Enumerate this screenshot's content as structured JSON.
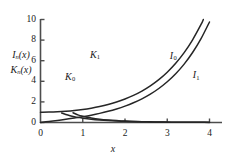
{
  "chart_data": {
    "type": "line",
    "title": "",
    "xlabel": "x",
    "ylabel_line1": "I",
    "ylabel_line1_sub": "n",
    "ylabel_line1_arg": "(x)",
    "ylabel_line2": "K",
    "ylabel_line2_sub": "n",
    "ylabel_line2_arg": "(x)",
    "xlim": [
      0,
      4
    ],
    "ylim": [
      0,
      10
    ],
    "xticks": [
      0,
      1,
      2,
      3,
      4
    ],
    "xtick_labels": [
      "0",
      "1",
      "2",
      "3",
      "4"
    ],
    "yticks": [
      0,
      2,
      4,
      6,
      8,
      10
    ],
    "ytick_labels": [
      "0",
      "2",
      "4",
      "6",
      "8",
      "10"
    ],
    "grid": false,
    "legend": "inline-curve-labels",
    "line_color": "#262626",
    "axis_color": "#4d4d4d",
    "background": "#ffffff",
    "series": [
      {
        "name": "I0",
        "label": "I",
        "label_sub": "0",
        "label_x": 3.18,
        "label_y": 6.45,
        "x": [
          0,
          0.2,
          0.4,
          0.6,
          0.8,
          1.0,
          1.2,
          1.4,
          1.6,
          1.8,
          2.0,
          2.2,
          2.4,
          2.6,
          2.8,
          3.0,
          3.2,
          3.4,
          3.6,
          3.8,
          4.0
        ],
        "y": [
          1.0,
          1.01,
          1.04,
          1.092,
          1.167,
          1.266,
          1.394,
          1.553,
          1.75,
          1.99,
          2.28,
          2.629,
          3.049,
          3.553,
          4.157,
          4.881,
          5.747,
          6.785,
          8.028,
          9.517,
          11.302
        ]
      },
      {
        "name": "I1",
        "label": "I",
        "label_sub": "1",
        "label_x": 3.72,
        "label_y": 4.58,
        "x": [
          0,
          0.2,
          0.4,
          0.6,
          0.8,
          1.0,
          1.2,
          1.4,
          1.6,
          1.8,
          2.0,
          2.2,
          2.4,
          2.6,
          2.8,
          3.0,
          3.2,
          3.4,
          3.6,
          3.8,
          4.0
        ],
        "y": [
          0.0,
          0.1005,
          0.204,
          0.3137,
          0.4329,
          0.5652,
          0.7147,
          0.8861,
          1.0848,
          1.3172,
          1.5906,
          1.9141,
          2.2981,
          2.7554,
          3.3011,
          3.9534,
          4.7343,
          5.6701,
          6.7927,
          8.1404,
          9.7595
        ]
      },
      {
        "name": "K0",
        "label": "K",
        "label_sub": "0",
        "label_x": 0.7,
        "label_y": 4.45,
        "x": [
          0.5,
          0.6,
          0.7,
          0.8,
          0.9,
          1.0,
          1.2,
          1.4,
          1.6,
          1.8,
          2.0,
          2.2,
          2.4,
          2.6,
          2.8,
          3.0,
          3.2,
          3.4,
          3.6,
          3.8,
          4.0
        ],
        "y": [
          0.9244,
          0.7775,
          0.6605,
          0.5653,
          0.4867,
          0.421,
          0.3185,
          0.2437,
          0.188,
          0.1459,
          0.1139,
          0.0893,
          0.0702,
          0.0554,
          0.0438,
          0.0347,
          0.0276,
          0.022,
          0.0175,
          0.014,
          0.0112
        ]
      },
      {
        "name": "K1",
        "label": "K",
        "label_sub": "1",
        "label_x": 1.29,
        "label_y": 6.55,
        "x": [
          0.77,
          0.9,
          1.0,
          1.1,
          1.2,
          1.4,
          1.6,
          1.8,
          2.0,
          2.2,
          2.4,
          2.6,
          2.8,
          3.0,
          3.2,
          3.4,
          3.6,
          3.8,
          4.0
        ],
        "y": [
          0.9496,
          0.7165,
          0.6019,
          0.5098,
          0.4346,
          0.3208,
          0.2406,
          0.1826,
          0.1399,
          0.1079,
          0.0837,
          0.0653,
          0.0511,
          0.0402,
          0.0316,
          0.025,
          0.0198,
          0.0157,
          0.0125
        ]
      }
    ]
  },
  "axes": {
    "x_axis_name": "x-axis",
    "y_axis_name": "y-axis"
  }
}
